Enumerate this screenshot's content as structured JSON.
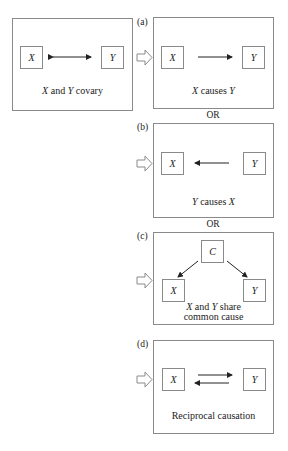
{
  "figure": {
    "premise": {
      "node_left": "X",
      "node_right": "Y",
      "relation": "bidirectional-arrow",
      "caption_parts": [
        "X",
        " and ",
        "Y",
        " covary"
      ]
    },
    "panels": [
      {
        "label": "(a)",
        "nodes": [
          "X",
          "Y"
        ],
        "relation": "X-to-Y",
        "caption_parts": [
          "X",
          " causes ",
          "Y"
        ]
      },
      {
        "label": "(b)",
        "nodes": [
          "X",
          "Y"
        ],
        "relation": "Y-to-X",
        "caption_parts": [
          "Y",
          " causes ",
          "X"
        ]
      },
      {
        "label": "(c)",
        "nodes": [
          "C",
          "X",
          "Y"
        ],
        "relation": "C-to-X-and-C-to-Y",
        "caption_line1_parts": [
          "X",
          " and ",
          "Y",
          " share"
        ],
        "caption_line2": "common cause"
      },
      {
        "label": "(d)",
        "nodes": [
          "X",
          "Y"
        ],
        "relation": "reciprocal",
        "caption": "Reciprocal causation"
      }
    ],
    "separator": "OR",
    "colors": {
      "line": "#8a8a8a",
      "arrow": "#222222",
      "text": "#222222",
      "background": "#ffffff"
    }
  }
}
